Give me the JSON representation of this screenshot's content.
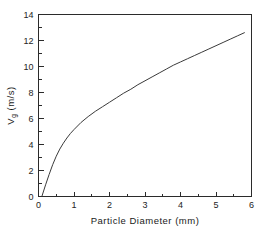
{
  "chart_data": {
    "type": "line",
    "title": "",
    "xlabel": "Particle  Diameter  (mm)",
    "ylabel": "V",
    "ylabel_sub": "g",
    "ylabel_units": "(m/s)",
    "xlim": [
      0,
      6
    ],
    "ylim": [
      0,
      14
    ],
    "xticks": [
      0,
      1,
      2,
      3,
      4,
      5,
      6
    ],
    "xtick_labels": [
      "0",
      "1",
      "2",
      "3",
      "4",
      "5",
      "6"
    ],
    "yticks": [
      0,
      2,
      4,
      6,
      8,
      10,
      12,
      14
    ],
    "ytick_labels": [
      "0",
      "2",
      "4",
      "6",
      "8",
      "10",
      "12",
      "14"
    ],
    "x_minor_ticks": [
      0.5,
      1.5,
      2.5,
      3.5,
      4.5,
      5.5
    ],
    "y_minor_ticks": [
      1,
      3,
      5,
      7,
      9,
      11,
      13
    ],
    "grid": false,
    "legend": false,
    "frame": "box",
    "tick_direction": "in",
    "series": [
      {
        "name": "terminal velocity",
        "color": "#3a3a3a",
        "x": [
          0.1,
          0.2,
          0.3,
          0.4,
          0.5,
          0.6,
          0.7,
          0.8,
          0.9,
          1.0,
          1.2,
          1.4,
          1.6,
          1.8,
          2.0,
          2.2,
          2.4,
          2.6,
          2.8,
          3.0,
          3.2,
          3.4,
          3.6,
          3.8,
          4.0,
          4.2,
          4.4,
          4.6,
          4.8,
          5.0,
          5.2,
          5.4,
          5.6,
          5.8
        ],
        "y": [
          0.05,
          0.9,
          1.7,
          2.45,
          3.1,
          3.65,
          4.1,
          4.5,
          4.85,
          5.15,
          5.7,
          6.15,
          6.55,
          6.9,
          7.25,
          7.6,
          7.95,
          8.25,
          8.6,
          8.9,
          9.2,
          9.5,
          9.8,
          10.1,
          10.35,
          10.6,
          10.85,
          11.1,
          11.35,
          11.6,
          11.85,
          12.1,
          12.35,
          12.6
        ]
      }
    ]
  }
}
